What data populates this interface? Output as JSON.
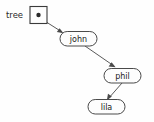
{
  "diagram": {
    "type": "pointer-linked-structure",
    "background_color": "#fefefe",
    "stroke_color": "#4a4a4a",
    "text_color": "#1a1a1a",
    "variable": {
      "label": "tree",
      "pointer_box": {
        "name": "pointer-cell",
        "contains": "filled-dot"
      }
    },
    "nodes": [
      {
        "id": "john",
        "label": "john",
        "shape": "rounded-rect"
      },
      {
        "id": "phil",
        "label": "phil",
        "shape": "rounded-rect"
      },
      {
        "id": "lila",
        "label": "lila",
        "shape": "rounded-rect"
      }
    ],
    "edges": [
      {
        "from": "tree",
        "to": "john",
        "arrow": true
      },
      {
        "from": "john",
        "to": "phil",
        "arrow": true
      },
      {
        "from": "phil",
        "to": "lila",
        "arrow": true
      }
    ]
  }
}
